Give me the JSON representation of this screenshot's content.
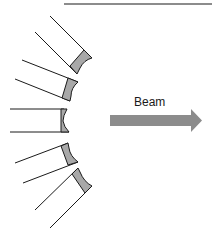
{
  "diagram": {
    "beam": {
      "label": "Beam",
      "color": "#8c8c8c"
    },
    "detector_cap_color": "#a8a8a8",
    "line_color": "#1a1a1a",
    "detector_count": 5
  }
}
